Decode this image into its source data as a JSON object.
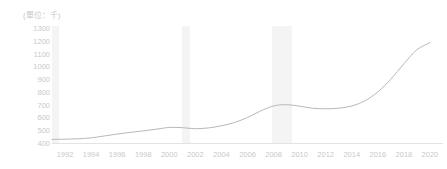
{
  "chart_data": {
    "type": "line",
    "title": "",
    "unit_label": "(單位：千)",
    "xlabel": "",
    "ylabel": "",
    "ylim": [
      400,
      1300
    ],
    "xlim": [
      1991,
      2021
    ],
    "grid": false,
    "legend": null,
    "y_ticks": [
      1300,
      1200,
      1100,
      1000,
      900,
      800,
      700,
      600,
      500,
      400
    ],
    "x_ticks": [
      1992,
      1994,
      1996,
      1998,
      2000,
      2002,
      2004,
      2006,
      2008,
      2010,
      2012,
      2014,
      2016,
      2018,
      2020
    ],
    "line_color": "#b8b8b8",
    "band_color": "#f4f4f4",
    "axis_text_color": "#c9c9c9",
    "shaded_bands": [
      {
        "name": "band-1991",
        "start": 1991.0,
        "end": 1991.5
      },
      {
        "name": "band-2001",
        "start": 2001.0,
        "end": 2001.6
      },
      {
        "name": "band-2008",
        "start": 2007.9,
        "end": 2009.4
      }
    ],
    "series": [
      {
        "name": "value",
        "x": [
          1991,
          1992,
          1993,
          1994,
          1995,
          1996,
          1997,
          1998,
          1999,
          2000,
          2001,
          2002,
          2003,
          2004,
          2005,
          2006,
          2007,
          2008,
          2009,
          2010,
          2011,
          2012,
          2013,
          2014,
          2015,
          2016,
          2017,
          2018,
          2019,
          2020
        ],
        "values": [
          428,
          430,
          433,
          440,
          455,
          470,
          483,
          495,
          508,
          522,
          520,
          512,
          518,
          535,
          560,
          600,
          650,
          690,
          700,
          688,
          672,
          668,
          672,
          690,
          730,
          800,
          900,
          1020,
          1130,
          1185
        ]
      }
    ]
  }
}
